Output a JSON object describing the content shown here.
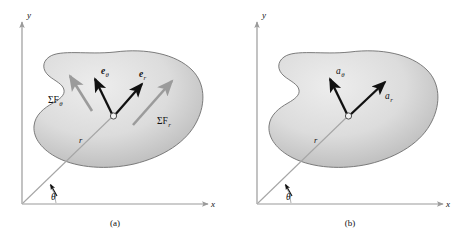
{
  "figure": {
    "background_color": "#ffffff",
    "blob_fill_light": "#e9e9e9",
    "blob_fill_dark": "#b4b4b4",
    "blob_stroke": "#6e6e6e",
    "axis_color": "#9a9a9a",
    "black_vector_color": "#111111",
    "gray_vector_color": "#9b9b9b",
    "radial_line_color": "#a6a6a6"
  },
  "panels": [
    {
      "id": "a",
      "caption": "(a)",
      "axes": {
        "y_label": "y",
        "x_label": "x"
      },
      "angle_label": "θ",
      "radius_label": "r",
      "vectors": [
        {
          "name": "e-theta-unit-vector",
          "label_main": "e",
          "label_sub": "θ",
          "style": "black",
          "bold": true
        },
        {
          "name": "e-r-unit-vector",
          "label_main": "e",
          "label_sub": "r",
          "style": "black",
          "bold": true
        },
        {
          "name": "sum-f-theta-force",
          "label_main": "ΣF",
          "label_sub": "θ",
          "style": "gray",
          "bold": false
        },
        {
          "name": "sum-f-r-force",
          "label_main": "ΣF",
          "label_sub": "r",
          "style": "gray",
          "bold": false
        }
      ]
    },
    {
      "id": "b",
      "caption": "(b)",
      "axes": {
        "y_label": "y",
        "x_label": "x"
      },
      "angle_label": "θ",
      "radius_label": "r",
      "vectors": [
        {
          "name": "a-theta-acceleration",
          "label_main": "a",
          "label_sub": "θ",
          "style": "black",
          "bold": false
        },
        {
          "name": "a-r-acceleration",
          "label_main": "a",
          "label_sub": "r",
          "style": "black",
          "bold": false
        }
      ]
    }
  ]
}
